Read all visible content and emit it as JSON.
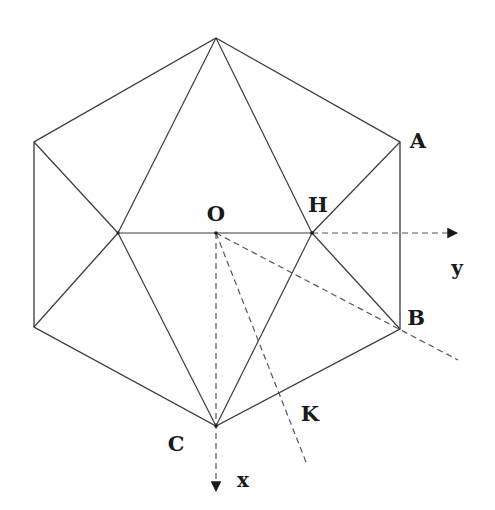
{
  "figure": {
    "colors": {
      "line": "#3a3a3a",
      "dashed": "#555555",
      "text": "#1a1a1a",
      "background": "#ffffff"
    },
    "labels": {
      "O": "O",
      "H": "H",
      "A": "A",
      "B": "B",
      "C": "C",
      "K": "K",
      "y_axis": "y",
      "x_axis": "x"
    },
    "points": {
      "top": [
        216,
        38
      ],
      "A": [
        400,
        142
      ],
      "B": [
        400,
        329
      ],
      "C": [
        216,
        426
      ],
      "lower_left": [
        34,
        327
      ],
      "upper_left": [
        34,
        142
      ],
      "left_mid": [
        118,
        233
      ],
      "O": [
        216,
        233
      ],
      "H": [
        312,
        233
      ]
    }
  }
}
